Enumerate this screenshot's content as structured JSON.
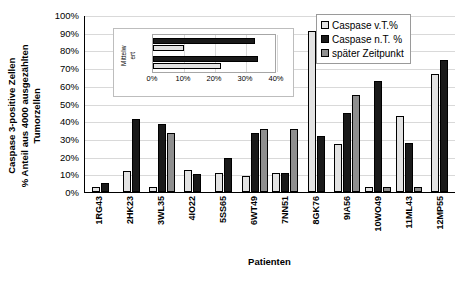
{
  "chart_data": {
    "type": "bar",
    "title": "",
    "xlabel": "Patienten",
    "ylabel": "Caspase 3-positive Zellen % Anteil aus 4000 ausgezählten Tumorzellen",
    "ylabel_lines": [
      "Caspase 3-positive Zellen",
      "% Anteil aus 4000 ausgezählten",
      "Tumorzellen"
    ],
    "ylim": [
      0,
      100
    ],
    "yticks": [
      "0%",
      "10%",
      "20%",
      "30%",
      "40%",
      "50%",
      "60%",
      "70%",
      "80%",
      "90%",
      "100%"
    ],
    "ytick_values": [
      0,
      10,
      20,
      30,
      40,
      50,
      60,
      70,
      80,
      90,
      100
    ],
    "grid": true,
    "legend_position": "top-right",
    "categories": [
      "1RG43",
      "2HK23",
      "3WL35",
      "4IO22",
      "5SS65",
      "6WT49",
      "7NN51",
      "8GK76",
      "9IA56",
      "10WO49",
      "11ML43",
      "12MP55"
    ],
    "series": [
      {
        "name": "Caspase v.T.%",
        "color": "#e3e3e3",
        "values": [
          3,
          12,
          3,
          12.5,
          10.5,
          9,
          10.5,
          91,
          27,
          3,
          43,
          66.5
        ]
      },
      {
        "name": "Caspase n.T. %",
        "color": "#1a1a1a",
        "values": [
          5,
          41,
          38.5,
          10,
          19.5,
          33.5,
          10.5,
          31.5,
          44.5,
          63,
          27.5,
          74.5
        ]
      },
      {
        "name": "später Zeitpunkt",
        "color": "#8f8f8f",
        "values": [
          null,
          null,
          33.5,
          null,
          null,
          35.5,
          35.5,
          null,
          55,
          3,
          3,
          null
        ]
      }
    ]
  },
  "inset_chart_data": {
    "type": "bar",
    "orientation": "horizontal",
    "title": "",
    "ylabel": "Mittelwert",
    "ylabel_lines": [
      "Mittelw",
      "ert"
    ],
    "xlim": [
      0,
      40
    ],
    "xticks": [
      "0%",
      "10%",
      "20%",
      "30%",
      "40%"
    ],
    "xtick_values": [
      0,
      10,
      20,
      30,
      40
    ],
    "grid": true,
    "categories": [
      "Gruppe 1",
      "Gruppe 2"
    ],
    "series": [
      {
        "name": "Caspase n.T. %",
        "color": "#1a1a1a",
        "values": [
          33,
          34
        ]
      },
      {
        "name": "Caspase v.T.%",
        "color": "#e3e3e3",
        "values": [
          10,
          22
        ]
      }
    ]
  },
  "legend": {
    "items": [
      {
        "label": "Caspase v.T.%",
        "swatch": "s0"
      },
      {
        "label": "Caspase n.T. %",
        "swatch": "s1"
      },
      {
        "label": "später Zeitpunkt",
        "swatch": "s2"
      }
    ]
  }
}
